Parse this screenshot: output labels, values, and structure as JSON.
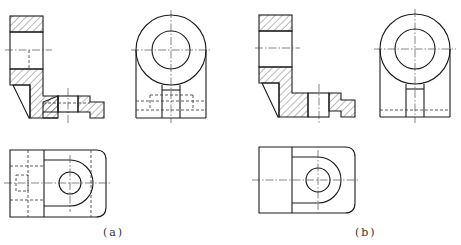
{
  "figure": {
    "panels": [
      {
        "id": "a",
        "label": "(a)",
        "views": [
          "sectioned front view",
          "side view with hidden lines",
          "top view with hidden lines"
        ]
      },
      {
        "id": "b",
        "label": "(b)",
        "views": [
          "sectioned front view",
          "side view",
          "top view"
        ]
      }
    ],
    "colors": {
      "line": "#1a1a1a",
      "background": "#ffffff"
    }
  }
}
